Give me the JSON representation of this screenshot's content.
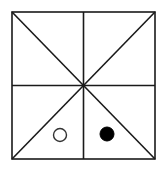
{
  "diagram": {
    "type": "board-grid",
    "square": {
      "x1": 12,
      "y1": 12,
      "x2": 155,
      "y2": 159
    },
    "center": {
      "x": 83.5,
      "y": 85.5
    },
    "line_color": "#1a1a1a",
    "pieces": [
      {
        "name": "hollow-circle",
        "fill": "none",
        "cx": 60,
        "cy": 135,
        "r": 6.5,
        "color": "#333333"
      },
      {
        "name": "filled-circle",
        "fill": "#000000",
        "cx": 107,
        "cy": 134,
        "r": 7,
        "color": "#000000"
      }
    ]
  }
}
